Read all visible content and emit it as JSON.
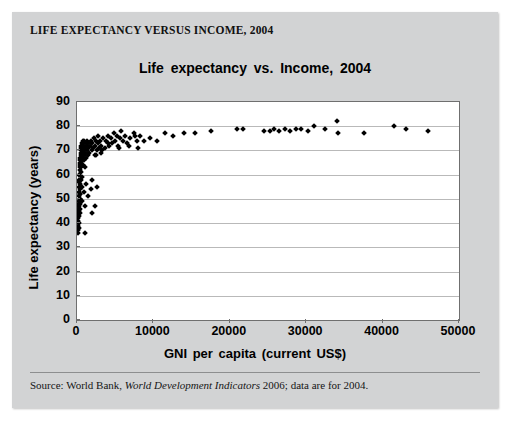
{
  "panel": {
    "header": "LIFE EXPECTANCY VERSUS INCOME, 2004",
    "source_prefix": "Source: World Bank, ",
    "source_italic": "World Development Indicators",
    "source_suffix": " 2006; data are for 2004."
  },
  "chart_data": {
    "type": "scatter",
    "title": "Life expectancy vs. Income, 2004",
    "xlabel": "GNI per capita (current US$)",
    "ylabel": "Life expectancy (years)",
    "xlim": [
      0,
      50000
    ],
    "ylim": [
      0,
      90
    ],
    "xticks": [
      0,
      10000,
      20000,
      30000,
      40000,
      50000
    ],
    "yticks": [
      0,
      10,
      20,
      30,
      40,
      50,
      60,
      70,
      80,
      90
    ],
    "grid": "horizontal",
    "legend": "none",
    "marker": "diamond",
    "marker_color": "#000000",
    "points": [
      [
        90,
        37
      ],
      [
        110,
        41
      ],
      [
        120,
        45
      ],
      [
        130,
        39
      ],
      [
        140,
        43
      ],
      [
        150,
        48
      ],
      [
        160,
        36
      ],
      [
        170,
        44
      ],
      [
        180,
        47
      ],
      [
        190,
        42
      ],
      [
        200,
        46
      ],
      [
        210,
        51
      ],
      [
        220,
        40
      ],
      [
        230,
        49
      ],
      [
        240,
        53
      ],
      [
        250,
        38
      ],
      [
        260,
        55
      ],
      [
        270,
        43
      ],
      [
        280,
        57
      ],
      [
        290,
        45
      ],
      [
        300,
        58
      ],
      [
        310,
        47
      ],
      [
        320,
        60
      ],
      [
        330,
        50
      ],
      [
        340,
        62
      ],
      [
        350,
        44
      ],
      [
        360,
        63
      ],
      [
        370,
        52
      ],
      [
        380,
        64
      ],
      [
        390,
        46
      ],
      [
        400,
        65
      ],
      [
        410,
        54
      ],
      [
        420,
        66
      ],
      [
        430,
        48
      ],
      [
        440,
        67
      ],
      [
        450,
        56
      ],
      [
        460,
        68
      ],
      [
        470,
        58
      ],
      [
        480,
        69
      ],
      [
        490,
        61
      ],
      [
        500,
        70
      ],
      [
        520,
        63
      ],
      [
        540,
        71
      ],
      [
        560,
        65
      ],
      [
        580,
        72
      ],
      [
        600,
        59
      ],
      [
        620,
        73
      ],
      [
        640,
        66
      ],
      [
        660,
        68
      ],
      [
        680,
        70
      ],
      [
        700,
        72
      ],
      [
        720,
        64
      ],
      [
        740,
        74
      ],
      [
        760,
        67
      ],
      [
        780,
        69
      ],
      [
        800,
        71
      ],
      [
        830,
        73
      ],
      [
        860,
        66
      ],
      [
        890,
        68
      ],
      [
        920,
        70
      ],
      [
        950,
        72
      ],
      [
        980,
        74
      ],
      [
        1010,
        63
      ],
      [
        1050,
        69
      ],
      [
        1100,
        71
      ],
      [
        1150,
        73
      ],
      [
        1200,
        67
      ],
      [
        1250,
        70
      ],
      [
        1300,
        72
      ],
      [
        1350,
        74
      ],
      [
        1400,
        68
      ],
      [
        1450,
        71
      ],
      [
        1500,
        73
      ],
      [
        1600,
        69
      ],
      [
        1700,
        72
      ],
      [
        1800,
        74
      ],
      [
        1900,
        70
      ],
      [
        2000,
        73
      ],
      [
        2100,
        71
      ],
      [
        2200,
        75
      ],
      [
        2300,
        68
      ],
      [
        2400,
        72
      ],
      [
        2500,
        74
      ],
      [
        2600,
        70
      ],
      [
        2700,
        73
      ],
      [
        2800,
        76
      ],
      [
        2900,
        71
      ],
      [
        3000,
        74
      ],
      [
        3100,
        69
      ],
      [
        3200,
        72
      ],
      [
        3400,
        75
      ],
      [
        3600,
        71
      ],
      [
        3800,
        74
      ],
      [
        4000,
        76
      ],
      [
        4200,
        72
      ],
      [
        4400,
        75
      ],
      [
        4600,
        73
      ],
      [
        4800,
        77
      ],
      [
        5000,
        74
      ],
      [
        5200,
        76
      ],
      [
        5400,
        72
      ],
      [
        5600,
        75
      ],
      [
        5800,
        78
      ],
      [
        6000,
        74
      ],
      [
        6300,
        76
      ],
      [
        6600,
        73
      ],
      [
        7000,
        75
      ],
      [
        7400,
        77
      ],
      [
        7800,
        74
      ],
      [
        8200,
        76
      ],
      [
        400,
        52
      ],
      [
        450,
        50
      ],
      [
        600,
        55
      ],
      [
        700,
        49
      ],
      [
        900,
        53
      ],
      [
        1000,
        47
      ],
      [
        1200,
        56
      ],
      [
        1500,
        51
      ],
      [
        1800,
        54
      ],
      [
        2000,
        58
      ],
      [
        2400,
        47
      ],
      [
        2600,
        55
      ],
      [
        1100,
        36
      ],
      [
        1900,
        44
      ],
      [
        9500,
        75
      ],
      [
        10500,
        74
      ],
      [
        11500,
        77
      ],
      [
        12500,
        76
      ],
      [
        14000,
        77
      ],
      [
        15500,
        77
      ],
      [
        17500,
        78
      ],
      [
        21000,
        79
      ],
      [
        21700,
        79
      ],
      [
        24500,
        78
      ],
      [
        25200,
        78
      ],
      [
        25800,
        79
      ],
      [
        26500,
        78
      ],
      [
        27200,
        79
      ],
      [
        27900,
        78
      ],
      [
        28600,
        79
      ],
      [
        29300,
        79
      ],
      [
        30200,
        78
      ],
      [
        31000,
        80
      ],
      [
        32500,
        79
      ],
      [
        34000,
        82
      ],
      [
        34100,
        77
      ],
      [
        37500,
        77
      ],
      [
        41500,
        80
      ],
      [
        43000,
        79
      ],
      [
        46000,
        78
      ],
      [
        2500,
        68
      ],
      [
        3300,
        70
      ],
      [
        4100,
        73
      ],
      [
        5500,
        71
      ],
      [
        6800,
        72
      ],
      [
        7600,
        76
      ],
      [
        8000,
        71
      ],
      [
        8800,
        74
      ]
    ]
  }
}
